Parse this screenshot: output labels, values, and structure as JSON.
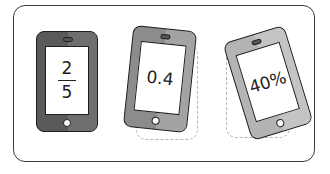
{
  "phones": [
    {
      "id": "fraction",
      "numerator": "2",
      "denominator": "5",
      "body_color": "#5a5a5a",
      "highlight_color": "#6f6f6f",
      "rotation_deg": 0
    },
    {
      "id": "decimal",
      "value": "0.4",
      "body_color": "#8c8c8c",
      "highlight_color": "#a3a3a3",
      "rotation_deg": 6
    },
    {
      "id": "percent",
      "value": "40%",
      "body_color": "#b4b4b4",
      "highlight_color": "#c4c4c4",
      "rotation_deg": -17
    }
  ],
  "colors": {
    "frame_border": "#3a3a3a",
    "dashed_outline": "#b5b5b5",
    "screen": "#ffffff",
    "outline": "#1e1e1e"
  }
}
